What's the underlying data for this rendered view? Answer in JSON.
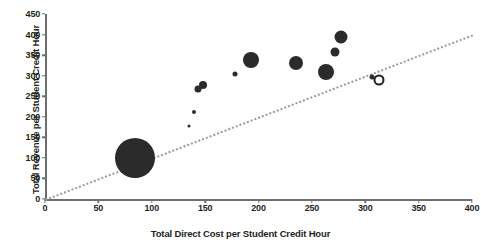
{
  "chart_data": {
    "type": "scatter",
    "title": "",
    "xlabel": "Total Direct Cost per Student Credit Hour",
    "ylabel": "Total Revenue per Student Credit Hour",
    "xlim": [
      0,
      400
    ],
    "ylim": [
      0,
      450
    ],
    "xticks": [
      0,
      50,
      100,
      150,
      200,
      250,
      300,
      350,
      400
    ],
    "yticks": [
      0,
      50,
      100,
      150,
      200,
      250,
      300,
      350,
      400,
      450
    ],
    "grid": false,
    "legend": null,
    "marker_style": "filled circle, size varies by bubble magnitude",
    "reference_line": {
      "label": "break-even diagonal (revenue = cost)",
      "style": "dotted",
      "color": "#9b9b9b",
      "x_start": 0,
      "y_start": 0,
      "x_end": 400,
      "y_end": 400
    },
    "points": [
      {
        "x": 84,
        "y": 100,
        "size": 40,
        "filled": true
      },
      {
        "x": 86,
        "y": 133,
        "size": 4,
        "filled": true
      },
      {
        "x": 135,
        "y": 178,
        "size": 3,
        "filled": true
      },
      {
        "x": 140,
        "y": 212,
        "size": 4,
        "filled": true
      },
      {
        "x": 143,
        "y": 268,
        "size": 7,
        "filled": true
      },
      {
        "x": 148,
        "y": 277,
        "size": 8,
        "filled": true
      },
      {
        "x": 178,
        "y": 305,
        "size": 5,
        "filled": true
      },
      {
        "x": 193,
        "y": 337,
        "size": 16,
        "filled": true
      },
      {
        "x": 235,
        "y": 330,
        "size": 14,
        "filled": true
      },
      {
        "x": 263,
        "y": 310,
        "size": 16,
        "filled": true
      },
      {
        "x": 272,
        "y": 358,
        "size": 9,
        "filled": true
      },
      {
        "x": 277,
        "y": 395,
        "size": 13,
        "filled": true
      },
      {
        "x": 306,
        "y": 296,
        "size": 5,
        "filled": true
      },
      {
        "x": 313,
        "y": 290,
        "size": 11,
        "filled": false
      }
    ]
  }
}
